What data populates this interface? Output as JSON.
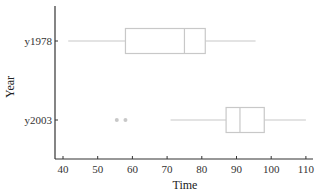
{
  "chart_data": {
    "type": "boxplot",
    "orientation": "horizontal",
    "title": "",
    "xlabel": "Time",
    "ylabel": "Year",
    "xlim": [
      38,
      112
    ],
    "xticks": [
      40,
      50,
      60,
      70,
      80,
      90,
      100,
      110
    ],
    "categories": [
      "y1978",
      "y2003"
    ],
    "series": [
      {
        "name": "y1978",
        "min": 41.5,
        "q1": 58,
        "median": 75,
        "q3": 81,
        "max": 95.5,
        "outliers": []
      },
      {
        "name": "y2003",
        "min": 71,
        "q1": 87,
        "median": 91,
        "q3": 98,
        "max": 110,
        "outliers": [
          55.5,
          58
        ]
      }
    ],
    "grid": false,
    "legend": null
  },
  "colors": {
    "box": "#c8c8c8",
    "axis": "#333333",
    "outlier": "#c8c8c8"
  }
}
